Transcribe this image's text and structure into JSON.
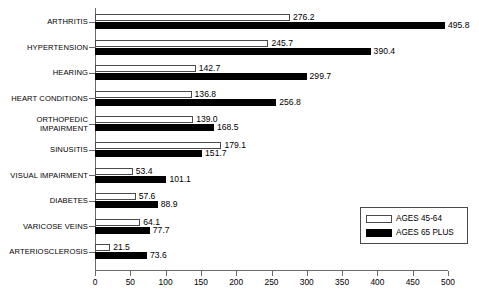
{
  "chart_data": {
    "type": "bar",
    "orientation": "horizontal",
    "title": "",
    "xlabel": "",
    "ylabel": "",
    "xlim": [
      0,
      500
    ],
    "xticks": [
      0,
      50,
      100,
      150,
      200,
      250,
      300,
      350,
      400,
      450,
      500
    ],
    "grid": false,
    "legend_position": "bottom-right",
    "categories": [
      "ARTHRITIS",
      "HYPERTENSION",
      "HEARING",
      "HEART CONDITIONS",
      "ORTHOPEDIC\nIMPAIRMENT",
      "SINUSITIS",
      "VISUAL IMPAIRMENT",
      "DIABETES",
      "VARICOSE VEINS",
      "ARTERIOSCLEROSIS"
    ],
    "series": [
      {
        "name": "AGES 45-64",
        "color": "#ffffff",
        "values": [
          276.2,
          245.7,
          142.7,
          136.8,
          139.0,
          179.1,
          53.4,
          57.6,
          64.1,
          21.5
        ],
        "labels": [
          "276.2",
          "245.7",
          "142.7",
          "136.8",
          "139.0",
          "179.1",
          "53.4",
          "57.6",
          "64.1",
          "21.5"
        ]
      },
      {
        "name": "AGES 65 PLUS",
        "color": "#000000",
        "values": [
          495.8,
          390.4,
          299.7,
          256.8,
          168.5,
          151.7,
          101.1,
          88.9,
          77.7,
          73.6
        ],
        "labels": [
          "495.8",
          "390.4",
          "299.7",
          "256.8",
          "168.5",
          "151.7",
          "101.1",
          "88.9",
          "77.7",
          "73.6"
        ]
      }
    ]
  },
  "legend": {
    "items": [
      {
        "label": "AGES 45-64"
      },
      {
        "label": "AGES 65 PLUS"
      }
    ]
  },
  "colors": {
    "series_light": "#ffffff",
    "series_dark": "#000000",
    "axis": "#6a6a6a",
    "background": "#ffffff"
  }
}
